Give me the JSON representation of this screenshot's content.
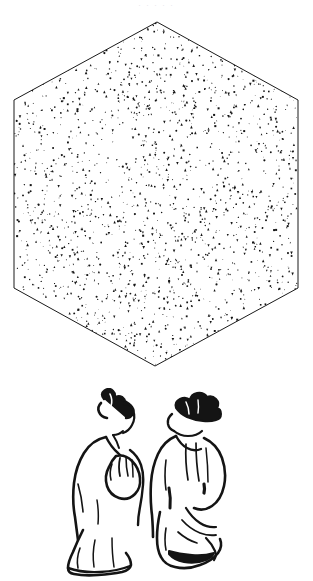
{
  "page": {
    "width": 313,
    "height": 581,
    "background_color": "#ffffff",
    "ink_color": "#1a1a1a",
    "media": "scanned-book-page",
    "faint_top_text": ". . . . ."
  },
  "figures": [
    {
      "id": "stippled-hexagon",
      "name": "hexagon-diagram",
      "shape": "hexagon",
      "orientation": "pointy-top",
      "fill_style": "random-triangle-stipple",
      "outline_color": "#1a1a1a",
      "outline_width_px": 1,
      "fill_color": "#ffffff",
      "stipple_color": "#151515",
      "stipple_count": 2100,
      "stipple_min_size_px": 0.7,
      "stipple_max_size_px": 2.6,
      "vertices": [
        {
          "x": 157,
          "y": 8
        },
        {
          "x": 298,
          "y": 86
        },
        {
          "x": 298,
          "y": 274
        },
        {
          "x": 155,
          "y": 352
        },
        {
          "x": 14,
          "y": 274
        },
        {
          "x": 14,
          "y": 86
        }
      ]
    },
    {
      "id": "brush-ink-figures",
      "name": "two-kneeling-figures",
      "style": "east-asian-brush-ink-line-drawing",
      "subjects": [
        {
          "id": "left-figure",
          "pose": "kneeling, three-quarter view, hands clasped at chest",
          "hair": "topknot",
          "garment": "long robe",
          "ink_color": "#141414"
        },
        {
          "id": "right-figure",
          "pose": "kneeling, seen from behind, robe draped over legs",
          "hair": "topknot with cap",
          "garment": "long robe",
          "ink_color": "#141414"
        }
      ]
    }
  ],
  "hexagon_geometry": {
    "center_x": 156,
    "center_y": 180,
    "half_width": 142,
    "half_height": 172
  }
}
